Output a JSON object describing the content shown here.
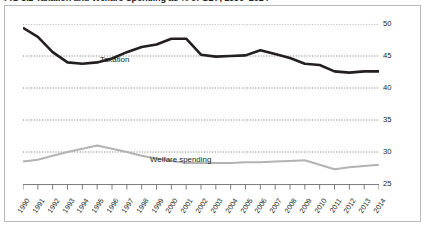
{
  "title": "FIG 3.2  Taxation and Welfare Spending as % of GDP, 1990–2014",
  "series_labels": {
    "taxation": "Taxation",
    "welfare": "Welfare spending"
  },
  "colors": {
    "taxation_line": "#231f20",
    "welfare_line": "#b3b3b3",
    "gridline": "#6d6e71",
    "frame": "#b9bcbe",
    "axis": "#6d6e71",
    "text": "#231f20",
    "background": "#ffffff"
  },
  "chart_data": {
    "type": "line",
    "title": "FIG 3.2  Taxation and Welfare Spending as % of GDP, 1990–2014",
    "xlabel": "",
    "ylabel": "",
    "ylim": [
      25,
      50
    ],
    "yticks": [
      25,
      30,
      35,
      40,
      45,
      50
    ],
    "ytick_labels": [
      "25",
      "30",
      "35",
      "40",
      "45",
      "50"
    ],
    "y_axis_position": "right",
    "grid": true,
    "grid_style": "dotted-horizontal",
    "legend": "inline-labels",
    "categories": [
      "1990",
      "1991",
      "1992",
      "1993",
      "1994",
      "1995",
      "1996",
      "1997",
      "1998",
      "1999",
      "2000",
      "2001",
      "2002",
      "2003",
      "2004",
      "2005",
      "2006",
      "2007",
      "2008",
      "2009",
      "2010",
      "2011",
      "2012",
      "2013",
      "2014"
    ],
    "series": [
      {
        "name": "Taxation",
        "color": "#231f20",
        "width": 2.6,
        "values": [
          49.4,
          48.0,
          45.6,
          44.0,
          43.8,
          44.0,
          44.6,
          45.6,
          46.4,
          46.8,
          47.7,
          47.7,
          45.2,
          44.9,
          45.0,
          45.1,
          45.9,
          45.3,
          44.7,
          43.8,
          43.6,
          42.6,
          42.4,
          42.6,
          42.6
        ]
      },
      {
        "name": "Welfare spending",
        "color": "#b3b3b3",
        "width": 2.0,
        "values": [
          28.5,
          28.8,
          29.4,
          30.0,
          30.5,
          31.0,
          30.5,
          30.0,
          29.4,
          29.0,
          28.6,
          28.3,
          28.3,
          28.3,
          28.3,
          28.4,
          28.4,
          28.5,
          28.6,
          28.7,
          28.0,
          27.3,
          27.6,
          27.8,
          28.0
        ]
      }
    ]
  }
}
